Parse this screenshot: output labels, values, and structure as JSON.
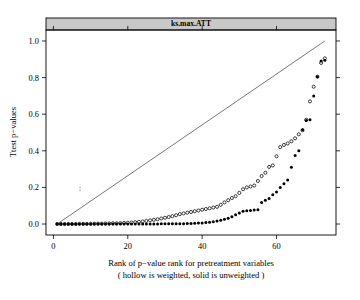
{
  "chart_data": {
    "type": "scatter",
    "title": "ks.max.ATT",
    "xlabel": "Rank of p−value rank for pretreatment variables",
    "xlabel2": "( hollow is weighted, solid is unweighted )",
    "ylabel": "Ttest p−values",
    "xlim": [
      -2.0,
      76.0
    ],
    "ylim": [
      -0.06,
      1.06
    ],
    "xticks": [
      0,
      20,
      40,
      60
    ],
    "xtick_labels": [
      "0",
      "20",
      "40",
      "60"
    ],
    "yticks": [
      0.0,
      0.2,
      0.4,
      0.6,
      0.8,
      1.0
    ],
    "ytick_labels": [
      "0.0",
      "0.2",
      "0.4",
      "0.6",
      "0.8",
      "1.0"
    ],
    "grid": false,
    "legend_position": "none",
    "reference_line": {
      "name": "identity-line",
      "x": [
        1,
        73
      ],
      "y": [
        0.0,
        1.0
      ]
    },
    "series": [
      {
        "name": "weighted",
        "marker": "hollow-circle",
        "color": "#000000",
        "x": [
          1,
          2,
          3,
          4,
          5,
          6,
          7,
          8,
          9,
          10,
          11,
          12,
          13,
          14,
          15,
          16,
          17,
          18,
          19,
          20,
          21,
          22,
          23,
          24,
          25,
          26,
          27,
          28,
          29,
          30,
          31,
          32,
          33,
          34,
          35,
          36,
          37,
          38,
          39,
          40,
          41,
          42,
          43,
          44,
          45,
          46,
          47,
          48,
          49,
          50,
          51,
          52,
          53,
          54,
          55,
          56,
          57,
          58,
          59,
          60,
          61,
          62,
          63,
          64,
          65,
          66,
          67,
          68,
          69,
          70,
          71,
          72,
          73
        ],
        "y": [
          0.0,
          0.0,
          0.0,
          0.0,
          0.0,
          0.0,
          0.001,
          0.001,
          0.001,
          0.001,
          0.002,
          0.002,
          0.002,
          0.003,
          0.003,
          0.004,
          0.004,
          0.005,
          0.006,
          0.007,
          0.008,
          0.01,
          0.012,
          0.014,
          0.017,
          0.02,
          0.023,
          0.026,
          0.03,
          0.034,
          0.038,
          0.043,
          0.048,
          0.054,
          0.058,
          0.062,
          0.066,
          0.07,
          0.074,
          0.078,
          0.082,
          0.086,
          0.09,
          0.094,
          0.105,
          0.118,
          0.13,
          0.142,
          0.152,
          0.17,
          0.19,
          0.2,
          0.205,
          0.21,
          0.235,
          0.262,
          0.28,
          0.312,
          0.32,
          0.37,
          0.42,
          0.432,
          0.44,
          0.452,
          0.468,
          0.49,
          0.512,
          0.57,
          0.67,
          0.75,
          0.805,
          0.88,
          0.905
        ]
      },
      {
        "name": "unweighted",
        "marker": "solid-circle",
        "color": "#000000",
        "x": [
          1,
          2,
          3,
          4,
          5,
          6,
          7,
          8,
          9,
          10,
          11,
          12,
          13,
          14,
          15,
          16,
          17,
          18,
          19,
          20,
          21,
          22,
          23,
          24,
          25,
          26,
          27,
          28,
          29,
          30,
          31,
          32,
          33,
          34,
          35,
          36,
          37,
          38,
          39,
          40,
          41,
          42,
          43,
          44,
          45,
          46,
          47,
          48,
          49,
          50,
          51,
          52,
          53,
          54,
          55,
          56,
          57,
          58,
          59,
          60,
          61,
          62,
          63,
          64,
          65,
          66,
          67,
          68,
          69,
          70,
          71,
          72,
          73
        ],
        "y": [
          0.0,
          0.0,
          0.0,
          0.0,
          0.0,
          0.0,
          0.0,
          0.0,
          0.0,
          0.0,
          0.0,
          0.0,
          0.0,
          0.0,
          0.0,
          0.0,
          0.0,
          0.0,
          0.0,
          0.0,
          0.0,
          0.0,
          0.0,
          0.0,
          0.0,
          0.0,
          0.0,
          0.0,
          0.001,
          0.001,
          0.001,
          0.001,
          0.002,
          0.002,
          0.002,
          0.003,
          0.003,
          0.004,
          0.005,
          0.006,
          0.008,
          0.01,
          0.013,
          0.016,
          0.02,
          0.026,
          0.032,
          0.04,
          0.05,
          0.06,
          0.07,
          0.072,
          0.074,
          0.076,
          0.078,
          0.118,
          0.13,
          0.14,
          0.16,
          0.175,
          0.2,
          0.22,
          0.24,
          0.31,
          0.375,
          0.4,
          0.515,
          0.565,
          0.57,
          0.7,
          0.805,
          0.89,
          0.895
        ]
      }
    ]
  }
}
